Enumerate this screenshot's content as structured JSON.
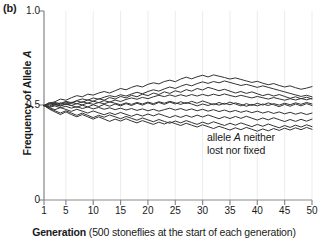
{
  "panel": {
    "label": "(b)"
  },
  "axes": {
    "y_title_prefix": "Frequency of Allele ",
    "y_title_italic": "A",
    "x_caption_bold": "Generation",
    "x_caption_rest": " (500 stoneflies at the start of each generation)"
  },
  "annotation": {
    "line1_prefix": "allele ",
    "line1_italic": "A",
    "line1_suffix": " neither",
    "line2": "lost nor fixed"
  },
  "colors": {
    "line": "#333333",
    "axis": "#8a8a8a",
    "grid": "#ececec",
    "text": "#1a1a1a"
  },
  "chart_data": {
    "type": "line",
    "title": "",
    "xlabel": "Generation (500 stoneflies at the start of each generation)",
    "ylabel": "Frequency of Allele A",
    "xlim": [
      1,
      50
    ],
    "ylim": [
      0,
      1.0
    ],
    "x_ticks": [
      1,
      5,
      10,
      15,
      20,
      25,
      30,
      35,
      40,
      45,
      50
    ],
    "x_tick_labels": [
      "1",
      "5",
      "10",
      "15",
      "20",
      "25",
      "30",
      "35",
      "40",
      "45",
      "50"
    ],
    "y_ticks": [
      0,
      0.5,
      1.0
    ],
    "y_tick_labels": [
      "0",
      "0.5",
      "1.0"
    ],
    "grid": "vertical-only-faint",
    "legend": "none",
    "annotations": [
      {
        "text": "allele A neither lost nor fixed",
        "x": 33,
        "y": 0.3
      }
    ],
    "x": [
      1,
      2,
      3,
      4,
      5,
      6,
      7,
      8,
      9,
      10,
      11,
      12,
      13,
      14,
      15,
      16,
      17,
      18,
      19,
      20,
      21,
      22,
      23,
      24,
      25,
      26,
      27,
      28,
      29,
      30,
      31,
      32,
      33,
      34,
      35,
      36,
      37,
      38,
      39,
      40,
      41,
      42,
      43,
      44,
      45,
      46,
      47,
      48,
      49,
      50
    ],
    "series": [
      {
        "name": "replicate 1",
        "values": [
          0.5,
          0.512,
          0.52,
          0.534,
          0.528,
          0.541,
          0.552,
          0.546,
          0.56,
          0.555,
          0.566,
          0.574,
          0.566,
          0.578,
          0.59,
          0.583,
          0.596,
          0.605,
          0.598,
          0.612,
          0.62,
          0.614,
          0.627,
          0.634,
          0.626,
          0.64,
          0.65,
          0.641,
          0.652,
          0.66,
          0.651,
          0.662,
          0.655,
          0.648,
          0.64,
          0.646,
          0.638,
          0.63,
          0.622,
          0.628,
          0.618,
          0.61,
          0.616,
          0.606,
          0.598,
          0.604,
          0.594,
          0.586,
          0.592,
          0.6
        ]
      },
      {
        "name": "replicate 2",
        "values": [
          0.5,
          0.506,
          0.516,
          0.51,
          0.522,
          0.515,
          0.526,
          0.535,
          0.528,
          0.54,
          0.533,
          0.544,
          0.552,
          0.546,
          0.557,
          0.55,
          0.561,
          0.57,
          0.562,
          0.574,
          0.583,
          0.576,
          0.588,
          0.598,
          0.59,
          0.602,
          0.612,
          0.604,
          0.616,
          0.625,
          0.617,
          0.627,
          0.62,
          0.63,
          0.622,
          0.614,
          0.606,
          0.612,
          0.604,
          0.596,
          0.604,
          0.596,
          0.588,
          0.58,
          0.572,
          0.564,
          0.556,
          0.548,
          0.554,
          0.546
        ]
      },
      {
        "name": "replicate 3",
        "values": [
          0.5,
          0.51,
          0.503,
          0.514,
          0.506,
          0.517,
          0.509,
          0.52,
          0.512,
          0.523,
          0.515,
          0.526,
          0.518,
          0.529,
          0.521,
          0.532,
          0.54,
          0.533,
          0.543,
          0.536,
          0.546,
          0.554,
          0.547,
          0.556,
          0.548,
          0.557,
          0.549,
          0.558,
          0.55,
          0.559,
          0.551,
          0.56,
          0.552,
          0.561,
          0.553,
          0.546,
          0.554,
          0.547,
          0.54,
          0.548,
          0.541,
          0.534,
          0.542,
          0.535,
          0.528,
          0.536,
          0.529,
          0.537,
          0.53,
          0.538
        ]
      },
      {
        "name": "replicate 4",
        "values": [
          0.5,
          0.494,
          0.504,
          0.497,
          0.507,
          0.5,
          0.51,
          0.503,
          0.513,
          0.506,
          0.516,
          0.509,
          0.519,
          0.512,
          0.504,
          0.514,
          0.506,
          0.516,
          0.508,
          0.518,
          0.51,
          0.52,
          0.512,
          0.522,
          0.514,
          0.506,
          0.516,
          0.508,
          0.498,
          0.508,
          0.5,
          0.51,
          0.502,
          0.512,
          0.504,
          0.514,
          0.506,
          0.496,
          0.506,
          0.498,
          0.508,
          0.5,
          0.51,
          0.502,
          0.512,
          0.504,
          0.514,
          0.506,
          0.516,
          0.508
        ]
      },
      {
        "name": "replicate 5",
        "values": [
          0.5,
          0.49,
          0.498,
          0.488,
          0.496,
          0.486,
          0.494,
          0.484,
          0.492,
          0.482,
          0.49,
          0.48,
          0.488,
          0.478,
          0.486,
          0.476,
          0.484,
          0.474,
          0.482,
          0.472,
          0.48,
          0.47,
          0.478,
          0.486,
          0.476,
          0.484,
          0.474,
          0.482,
          0.472,
          0.48,
          0.47,
          0.478,
          0.468,
          0.476,
          0.466,
          0.474,
          0.464,
          0.472,
          0.462,
          0.47,
          0.46,
          0.468,
          0.458,
          0.466,
          0.456,
          0.464,
          0.454,
          0.462,
          0.452,
          0.46
        ]
      },
      {
        "name": "replicate 6",
        "values": [
          0.5,
          0.488,
          0.478,
          0.489,
          0.479,
          0.469,
          0.48,
          0.47,
          0.46,
          0.471,
          0.461,
          0.451,
          0.462,
          0.452,
          0.463,
          0.453,
          0.443,
          0.454,
          0.444,
          0.455,
          0.445,
          0.456,
          0.446,
          0.436,
          0.447,
          0.437,
          0.448,
          0.438,
          0.449,
          0.439,
          0.45,
          0.44,
          0.43,
          0.441,
          0.431,
          0.442,
          0.432,
          0.443,
          0.433,
          0.423,
          0.434,
          0.424,
          0.435,
          0.425,
          0.415,
          0.426,
          0.416,
          0.427,
          0.417,
          0.428
        ]
      },
      {
        "name": "replicate 7",
        "values": [
          0.5,
          0.484,
          0.472,
          0.46,
          0.472,
          0.46,
          0.448,
          0.46,
          0.448,
          0.436,
          0.448,
          0.438,
          0.45,
          0.44,
          0.43,
          0.442,
          0.432,
          0.422,
          0.434,
          0.424,
          0.414,
          0.426,
          0.416,
          0.406,
          0.418,
          0.408,
          0.42,
          0.41,
          0.4,
          0.412,
          0.402,
          0.414,
          0.404,
          0.394,
          0.406,
          0.396,
          0.408,
          0.398,
          0.388,
          0.4,
          0.39,
          0.402,
          0.392,
          0.382,
          0.394,
          0.384,
          0.396,
          0.386,
          0.398,
          0.388
        ]
      },
      {
        "name": "replicate 8",
        "values": [
          0.5,
          0.48,
          0.466,
          0.452,
          0.466,
          0.452,
          0.44,
          0.452,
          0.44,
          0.428,
          0.44,
          0.428,
          0.416,
          0.428,
          0.418,
          0.43,
          0.418,
          0.408,
          0.42,
          0.41,
          0.4,
          0.412,
          0.402,
          0.414,
          0.404,
          0.394,
          0.406,
          0.396,
          0.386,
          0.398,
          0.388,
          0.378,
          0.39,
          0.38,
          0.37,
          0.382,
          0.372,
          0.384,
          0.374,
          0.364,
          0.376,
          0.366,
          0.378,
          0.368,
          0.38,
          0.37,
          0.382,
          0.372,
          0.384,
          0.374
        ]
      },
      {
        "name": "replicate 9",
        "values": [
          0.5,
          0.516,
          0.508,
          0.498,
          0.51,
          0.5,
          0.49,
          0.502,
          0.492,
          0.504,
          0.494,
          0.506,
          0.496,
          0.508,
          0.498,
          0.51,
          0.5,
          0.512,
          0.502,
          0.514,
          0.504,
          0.516,
          0.506,
          0.518,
          0.508,
          0.52,
          0.51,
          0.522,
          0.512,
          0.524,
          0.514,
          0.504,
          0.516,
          0.506,
          0.518,
          0.508,
          0.498,
          0.51,
          0.5,
          0.512,
          0.502,
          0.514,
          0.504,
          0.494,
          0.506,
          0.496,
          0.508,
          0.498,
          0.51,
          0.5
        ]
      },
      {
        "name": "replicate 10",
        "values": [
          0.5,
          0.498,
          0.512,
          0.504,
          0.518,
          0.51,
          0.524,
          0.516,
          0.53,
          0.522,
          0.536,
          0.528,
          0.542,
          0.534,
          0.548,
          0.54,
          0.554,
          0.546,
          0.56,
          0.552,
          0.566,
          0.558,
          0.572,
          0.564,
          0.578,
          0.57,
          0.584,
          0.576,
          0.59,
          0.582,
          0.596,
          0.588,
          0.578,
          0.586,
          0.576,
          0.566,
          0.574,
          0.564,
          0.572,
          0.562,
          0.552,
          0.56,
          0.55,
          0.558,
          0.548,
          0.538,
          0.546,
          0.536,
          0.544,
          0.534
        ]
      }
    ]
  }
}
